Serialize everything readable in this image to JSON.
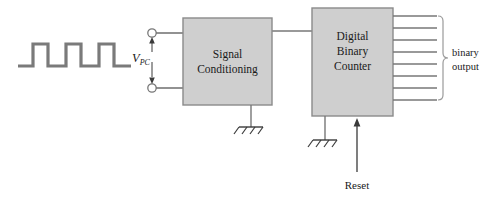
{
  "diagram": {
    "colors": {
      "stroke": "#777777",
      "block_fill": "#cfcfcf",
      "block_stroke": "#8a8a8a",
      "text": "#1a1a1a",
      "background": "#ffffff",
      "waveform": "#7a7a7a"
    },
    "waveform": {
      "name": "pulse-train",
      "pulse_count": 3,
      "baseline_y": 66,
      "peak_y": 44,
      "stroke_width": 3.2,
      "points": "18,66 33,66 33,44 48,44 48,66 66,66 66,44 81,44 81,66 99,66 99,44 114,44 114,66 131,66"
    },
    "terminals": {
      "name": "input-terminals",
      "top_label": "",
      "bottom_label": "",
      "voltage_symbol": "V",
      "voltage_subscript": "PC",
      "top_cx": 152,
      "top_cy": 33,
      "bottom_cx": 152,
      "bottom_cy": 88,
      "radius": 4.2
    },
    "blocks": [
      {
        "id": "signal-conditioning",
        "lines": [
          "Signal",
          "Conditioning"
        ],
        "x": 183,
        "y": 18,
        "width": 89,
        "height": 87
      },
      {
        "id": "digital-binary-counter",
        "lines": [
          "Digital",
          "Binary",
          "Counter"
        ],
        "x": 312,
        "y": 8,
        "width": 81,
        "height": 108
      }
    ],
    "grounds": [
      {
        "id": "ground-signal-conditioning",
        "x": 251,
        "y": 105,
        "stem": 22
      },
      {
        "id": "ground-binary-counter",
        "x": 325,
        "y": 116,
        "stem": 24
      }
    ],
    "reset": {
      "label": "Reset",
      "x": 357,
      "arrow_top_y": 118,
      "line_bottom_y": 172,
      "label_y": 189
    },
    "output_bus": {
      "label_lines": [
        "binary",
        "output"
      ],
      "line_count": 8,
      "line_start_x": 393,
      "line_end_x": 437,
      "first_y": 16,
      "spacing": 12,
      "brace_x": 443,
      "label_x": 452
    },
    "links": {
      "terminal_top_to_block": {
        "from_x": 156,
        "to_x": 183,
        "y": 33
      },
      "terminal_bottom_to_block": {
        "from_x": 156,
        "to_x": 183,
        "y": 88
      },
      "block_to_block": {
        "from_x": 272,
        "to_x": 312,
        "y": 31
      }
    }
  }
}
